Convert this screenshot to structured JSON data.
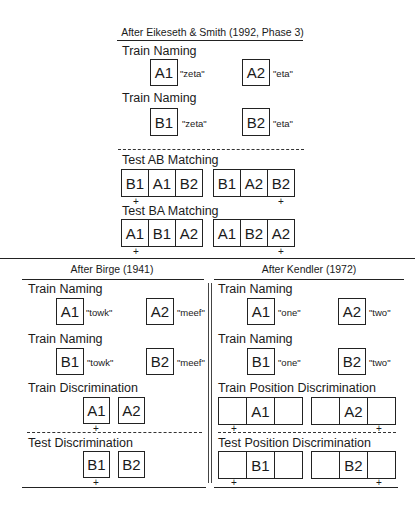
{
  "top": {
    "title": "After Eikeseth & Smith (1992, Phase 3)",
    "train1": {
      "label": "Train Naming",
      "a": "A1",
      "a_word": "\"zeta\"",
      "b": "A2",
      "b_word": "\"eta\""
    },
    "train2": {
      "label": "Train Naming",
      "a": "B1",
      "a_word": "\"zeta\"",
      "b": "B2",
      "b_word": "\"eta\""
    },
    "test_ab": {
      "label": "Test AB Matching",
      "left": [
        "B1",
        "A1",
        "B2"
      ],
      "right": [
        "B1",
        "A2",
        "B2"
      ]
    },
    "test_ba": {
      "label": "Test BA Matching",
      "left": [
        "A1",
        "B1",
        "A2"
      ],
      "right": [
        "A1",
        "B2",
        "A2"
      ]
    },
    "plus": "+"
  },
  "birge": {
    "title": "After Birge (1941)",
    "train1": {
      "label": "Train Naming",
      "a": "A1",
      "a_word": "\"towk\"",
      "b": "A2",
      "b_word": "\"meef\""
    },
    "train2": {
      "label": "Train Naming",
      "a": "B1",
      "a_word": "\"towk\"",
      "b": "B2",
      "b_word": "\"meef\""
    },
    "train_disc": {
      "label": "Train Discrimination",
      "a": "A1",
      "b": "A2"
    },
    "test_disc": {
      "label": "Test Discrimination",
      "a": "B1",
      "b": "B2"
    }
  },
  "kendler": {
    "title": "After Kendler (1972)",
    "train1": {
      "label": "Train Naming",
      "a": "A1",
      "a_word": "\"one\"",
      "b": "A2",
      "b_word": "\"two\""
    },
    "train2": {
      "label": "Train Naming",
      "a": "B1",
      "a_word": "\"one\"",
      "b": "B2",
      "b_word": "\"two\""
    },
    "train_pos": {
      "label": "Train Position Discrimination",
      "left": [
        "",
        "A1",
        ""
      ],
      "right": [
        "",
        "A2",
        ""
      ]
    },
    "test_pos": {
      "label": "Test Position Discrimination",
      "left": [
        "",
        "B1",
        ""
      ],
      "right": [
        "",
        "B2",
        ""
      ]
    }
  }
}
